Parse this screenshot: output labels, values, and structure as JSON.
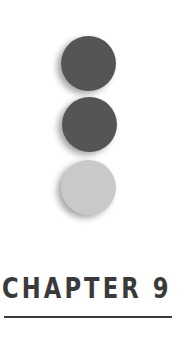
{
  "chapter": {
    "title": "CHAPTER 9"
  },
  "ornament": {
    "dots": [
      {
        "name": "dark-dot-top",
        "color": "#555555"
      },
      {
        "name": "dark-dot-middle",
        "color": "#555555"
      },
      {
        "name": "light-dot-bottom",
        "color": "#c9c9c9"
      }
    ]
  },
  "colors": {
    "text": "#3a3a3a",
    "rule": "#3a3a3a",
    "background": "#ffffff"
  }
}
